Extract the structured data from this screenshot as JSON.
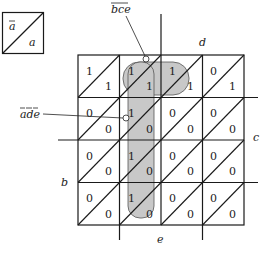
{
  "legend": {
    "upper_label": "a",
    "upper_negated": true,
    "lower_label": "a",
    "lower_negated": false
  },
  "axis_labels": {
    "d": "d",
    "c": "c",
    "b": "b",
    "e": "e"
  },
  "annotations": {
    "top": {
      "text": "bce",
      "negated": true
    },
    "left": {
      "text": "ade",
      "negated_parts": [
        "a",
        "d",
        "e"
      ]
    }
  },
  "grid": {
    "rows": 4,
    "cols": 4,
    "cells": [
      [
        {
          "upper": "1",
          "lower": "1"
        },
        {
          "upper": "1",
          "lower": "1"
        },
        {
          "upper": "1",
          "lower": "1"
        },
        {
          "upper": "0",
          "lower": "1"
        }
      ],
      [
        {
          "upper": "0",
          "lower": "0"
        },
        {
          "upper": "1",
          "lower": "0"
        },
        {
          "upper": "0",
          "lower": "0"
        },
        {
          "upper": "0",
          "lower": "0"
        }
      ],
      [
        {
          "upper": "0",
          "lower": "0"
        },
        {
          "upper": "1",
          "lower": "0"
        },
        {
          "upper": "0",
          "lower": "0"
        },
        {
          "upper": "0",
          "lower": "0"
        }
      ],
      [
        {
          "upper": "0",
          "lower": "0"
        },
        {
          "upper": "1",
          "lower": "0"
        },
        {
          "upper": "0",
          "lower": "0"
        },
        {
          "upper": "0",
          "lower": "0"
        }
      ]
    ]
  },
  "colors": {
    "line": "#1a1a1a",
    "shade": "#c8c8c8"
  }
}
